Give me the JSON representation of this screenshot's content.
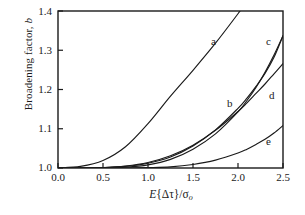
{
  "chart_data": {
    "type": "line",
    "title": "",
    "xlabel": "E{Δτ}/σo",
    "ylabel": "Broadening factor, b",
    "xlim": [
      0.0,
      2.5
    ],
    "ylim": [
      1.0,
      1.4
    ],
    "grid": false,
    "legend_position": "inline-curve-labels",
    "xticks": [
      "0.0",
      "0.5",
      "1.0",
      "1.5",
      "2.0",
      "2.5"
    ],
    "xtick_values": [
      0.0,
      0.5,
      1.0,
      1.5,
      2.0,
      2.5
    ],
    "yticks": [
      "1.0",
      "1.1",
      "1.2",
      "1.3",
      "1.4"
    ],
    "ytick_values": [
      1.0,
      1.1,
      1.2,
      1.3,
      1.4
    ],
    "x": [
      0.0,
      0.25,
      0.5,
      0.75,
      1.0,
      1.25,
      1.5,
      1.75,
      2.0,
      2.1,
      2.2,
      2.3,
      2.4,
      2.5
    ],
    "series": [
      {
        "name": "a",
        "label": "a",
        "values": [
          1.0,
          1.004,
          1.019,
          1.054,
          1.113,
          1.183,
          1.249,
          1.318,
          1.393,
          1.4,
          1.4,
          1.4,
          1.4,
          1.4
        ],
        "clipped_at_top": true,
        "exit_x": 2.02
      },
      {
        "name": "b",
        "label": "b",
        "values": [
          1.0,
          1.0,
          1.001,
          1.004,
          1.012,
          1.028,
          1.056,
          1.097,
          1.152,
          1.178,
          1.208,
          1.241,
          1.282,
          1.337
        ]
      },
      {
        "name": "c",
        "label": "c",
        "values": [
          1.0,
          1.0,
          1.0,
          1.002,
          1.008,
          1.022,
          1.048,
          1.087,
          1.143,
          1.172,
          1.205,
          1.244,
          1.288,
          1.337
        ]
      },
      {
        "name": "d",
        "label": "d",
        "values": [
          1.0,
          1.0,
          1.001,
          1.005,
          1.014,
          1.031,
          1.058,
          1.096,
          1.144,
          1.166,
          1.19,
          1.214,
          1.24,
          1.266
        ]
      },
      {
        "name": "e",
        "label": "e",
        "values": [
          1.0,
          1.0,
          1.0,
          1.0,
          1.001,
          1.003,
          1.009,
          1.02,
          1.038,
          1.048,
          1.06,
          1.073,
          1.089,
          1.108
        ]
      }
    ],
    "curve_label_positions": [
      {
        "name": "a",
        "x_px": 211,
        "y_px": 35
      },
      {
        "name": "b",
        "x_px": 227,
        "y_px": 97
      },
      {
        "name": "c",
        "x_px": 266,
        "y_px": 35
      },
      {
        "name": "d",
        "x_px": 269,
        "y_px": 89
      },
      {
        "name": "e",
        "x_px": 266,
        "y_px": 135
      }
    ],
    "axis_color": "#1a1a1a",
    "curve_color": "#1a1a1a",
    "background": "#ffffff"
  }
}
